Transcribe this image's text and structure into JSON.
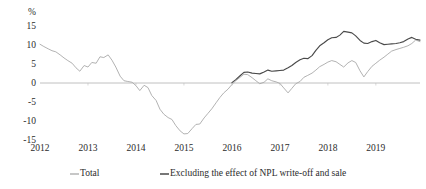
{
  "chart_data": {
    "type": "line",
    "title": "",
    "subtitle": "",
    "xlabel": "",
    "ylabel": "%",
    "unit_label": "%",
    "ylim": [
      -15,
      15
    ],
    "yticks": [
      15,
      10,
      5,
      0,
      -5,
      -10,
      -15
    ],
    "ytick_labels": [
      "15",
      "10",
      "5",
      "0",
      "-5",
      "-10",
      "-15"
    ],
    "xlim": [
      2012.0,
      2019.92
    ],
    "xticks": [
      2012,
      2013,
      2014,
      2015,
      2016,
      2017,
      2018,
      2019
    ],
    "xtick_labels": [
      "2012",
      "2013",
      "2014",
      "2015",
      "2016",
      "2017",
      "2018",
      "2019"
    ],
    "grid": false,
    "zero_line": true,
    "legend_position": "bottom",
    "colors": {
      "total": "#a9a9a9",
      "excluding_npl": "#4a4a4a",
      "zero_line": "#b9b9b9",
      "text": "#2b2b2b",
      "background": "#ffffff"
    },
    "series": [
      {
        "name": "Total",
        "color": "#a9a9a9",
        "x": [
          2012.0,
          2012.08,
          2012.17,
          2012.25,
          2012.33,
          2012.42,
          2012.5,
          2012.58,
          2012.67,
          2012.75,
          2012.83,
          2012.92,
          2013.0,
          2013.08,
          2013.17,
          2013.25,
          2013.33,
          2013.42,
          2013.5,
          2013.58,
          2013.67,
          2013.75,
          2013.83,
          2013.92,
          2014.0,
          2014.08,
          2014.17,
          2014.25,
          2014.33,
          2014.42,
          2014.5,
          2014.58,
          2014.67,
          2014.75,
          2014.83,
          2014.92,
          2015.0,
          2015.08,
          2015.17,
          2015.25,
          2015.33,
          2015.42,
          2015.5,
          2015.58,
          2015.67,
          2015.75,
          2015.83,
          2015.92,
          2016.0,
          2016.08,
          2016.17,
          2016.25,
          2016.33,
          2016.42,
          2016.5,
          2016.58,
          2016.67,
          2016.75,
          2016.83,
          2016.92,
          2017.0,
          2017.08,
          2017.17,
          2017.25,
          2017.33,
          2017.42,
          2017.5,
          2017.58,
          2017.67,
          2017.75,
          2017.83,
          2017.92,
          2018.0,
          2018.08,
          2018.17,
          2018.25,
          2018.33,
          2018.42,
          2018.5,
          2018.58,
          2018.67,
          2018.75,
          2018.83,
          2018.92,
          2019.0,
          2019.08,
          2019.17,
          2019.25,
          2019.33,
          2019.42,
          2019.5,
          2019.58,
          2019.67,
          2019.75,
          2019.83,
          2019.92
        ],
        "values": [
          10.2,
          9.6,
          9.0,
          8.5,
          8.2,
          7.4,
          6.6,
          5.9,
          5.2,
          4.0,
          3.1,
          4.6,
          4.2,
          5.4,
          5.2,
          6.9,
          6.7,
          7.4,
          6.0,
          4.2,
          1.8,
          0.6,
          0.4,
          0.2,
          -0.7,
          -2.0,
          -0.6,
          -1.2,
          -3.3,
          -4.6,
          -6.9,
          -8.2,
          -9.1,
          -9.6,
          -11.2,
          -12.6,
          -13.4,
          -13.3,
          -12.0,
          -10.9,
          -10.8,
          -9.2,
          -8.0,
          -6.8,
          -5.2,
          -3.8,
          -2.6,
          -1.6,
          -0.4,
          0.6,
          1.5,
          2.3,
          2.2,
          1.4,
          0.6,
          -0.2,
          0.2,
          1.1,
          0.6,
          0.3,
          -0.1,
          -1.3,
          -2.6,
          -1.4,
          -0.2,
          0.4,
          1.5,
          2.0,
          2.6,
          3.4,
          4.3,
          4.9,
          5.5,
          5.9,
          5.6,
          4.9,
          4.2,
          5.3,
          5.9,
          5.4,
          3.2,
          1.6,
          3.0,
          4.4,
          5.2,
          6.0,
          6.8,
          7.6,
          8.4,
          8.8,
          9.1,
          9.4,
          9.8,
          10.4,
          11.3,
          10.9
        ]
      },
      {
        "name": "Excluding the effect of NPL write-off and sale",
        "color": "#4a4a4a",
        "x": [
          2016.0,
          2016.08,
          2016.17,
          2016.25,
          2016.33,
          2016.42,
          2016.5,
          2016.58,
          2016.67,
          2016.75,
          2016.83,
          2016.92,
          2017.0,
          2017.08,
          2017.17,
          2017.25,
          2017.33,
          2017.42,
          2017.5,
          2017.58,
          2017.67,
          2017.75,
          2017.83,
          2017.92,
          2018.0,
          2018.08,
          2018.17,
          2018.25,
          2018.33,
          2018.42,
          2018.5,
          2018.58,
          2018.67,
          2018.75,
          2018.83,
          2018.92,
          2019.0,
          2019.08,
          2019.17,
          2019.25,
          2019.33,
          2019.42,
          2019.5,
          2019.58,
          2019.67,
          2019.75,
          2019.83,
          2019.92
        ],
        "values": [
          0.1,
          0.9,
          1.9,
          2.8,
          2.9,
          2.6,
          2.5,
          2.4,
          2.9,
          3.4,
          3.1,
          3.2,
          3.3,
          3.4,
          4.0,
          4.6,
          5.4,
          6.1,
          6.5,
          6.4,
          7.2,
          8.6,
          9.8,
          10.6,
          11.4,
          11.9,
          12.0,
          12.6,
          13.6,
          13.4,
          13.2,
          12.4,
          11.2,
          10.5,
          10.4,
          10.9,
          11.2,
          10.6,
          10.1,
          10.2,
          10.3,
          10.4,
          10.6,
          10.9,
          11.6,
          12.0,
          11.5,
          11.3
        ]
      }
    ]
  },
  "legend": {
    "items": [
      {
        "label": "Total",
        "key": "total"
      },
      {
        "label": "Excluding the effect of NPL write-off and sale",
        "key": "excluding_npl"
      }
    ]
  }
}
